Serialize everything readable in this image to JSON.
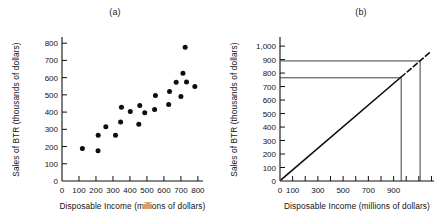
{
  "figure": {
    "panels": [
      {
        "id": "a",
        "caption": "(a)",
        "chart_index": 0
      },
      {
        "id": "b",
        "caption": "(b)",
        "chart_index": 1
      }
    ]
  },
  "chart_data": [
    {
      "type": "scatter",
      "title": "(a)",
      "xlabel": "Disposable Income (millions of dollars)",
      "ylabel": "Sales of BTR (thousands of dollars)",
      "xlim": [
        0,
        830
      ],
      "ylim": [
        0,
        830
      ],
      "xticks": [
        0,
        100,
        200,
        300,
        400,
        500,
        600,
        700,
        800
      ],
      "xticklabels": [
        "0",
        "100",
        "200",
        "300",
        "400",
        "500",
        "600",
        "700",
        "800"
      ],
      "yticks": [
        0,
        100,
        200,
        300,
        400,
        500,
        600,
        700,
        800
      ],
      "yticklabels": [
        "0",
        "100",
        "200",
        "300",
        "400",
        "500",
        "600",
        "700",
        "800"
      ],
      "grid": false,
      "legend": "none",
      "points": [
        {
          "x": 120,
          "y": 188
        },
        {
          "x": 212,
          "y": 175
        },
        {
          "x": 213,
          "y": 265
        },
        {
          "x": 258,
          "y": 315
        },
        {
          "x": 315,
          "y": 265
        },
        {
          "x": 345,
          "y": 343
        },
        {
          "x": 350,
          "y": 428
        },
        {
          "x": 402,
          "y": 403
        },
        {
          "x": 452,
          "y": 330
        },
        {
          "x": 458,
          "y": 438
        },
        {
          "x": 487,
          "y": 396
        },
        {
          "x": 545,
          "y": 415
        },
        {
          "x": 550,
          "y": 496
        },
        {
          "x": 628,
          "y": 444
        },
        {
          "x": 633,
          "y": 520
        },
        {
          "x": 672,
          "y": 573
        },
        {
          "x": 700,
          "y": 490
        },
        {
          "x": 712,
          "y": 625
        },
        {
          "x": 725,
          "y": 776
        },
        {
          "x": 733,
          "y": 575
        },
        {
          "x": 782,
          "y": 549
        }
      ]
    },
    {
      "type": "line",
      "title": "(b)",
      "xlabel": "Disposable Income (millions of dollars)",
      "ylabel": "Sales of BTR (thousands of dollars)",
      "xlim": [
        0,
        1220
      ],
      "ylim": [
        0,
        1060
      ],
      "xticks": [
        0,
        100,
        200,
        300,
        400,
        500,
        600,
        700,
        800,
        900,
        1000,
        1100,
        1200
      ],
      "xticklabels": [
        "0",
        "100",
        "",
        "300",
        "",
        "500",
        "",
        "700",
        "",
        "900",
        "",
        "",
        ""
      ],
      "yticks": [
        0,
        100,
        200,
        300,
        400,
        500,
        600,
        700,
        800,
        900,
        1000
      ],
      "yticklabels": [
        "0",
        "100",
        "200",
        "300",
        "400",
        "500",
        "600",
        "700",
        "800",
        "900",
        "1,000"
      ],
      "grid": false,
      "legend": "none",
      "series": [
        {
          "name": "fitted-regression-line",
          "style": "solid-then-dashed-extrapolation",
          "x": [
            10,
            1190
          ],
          "y": [
            10,
            955
          ],
          "dash_start_x": 960
        }
      ],
      "projections": [
        {
          "name": "lower-projection",
          "y": 765,
          "x": 960
        },
        {
          "name": "upper-projection",
          "y": 890,
          "x": 1110
        }
      ]
    }
  ]
}
